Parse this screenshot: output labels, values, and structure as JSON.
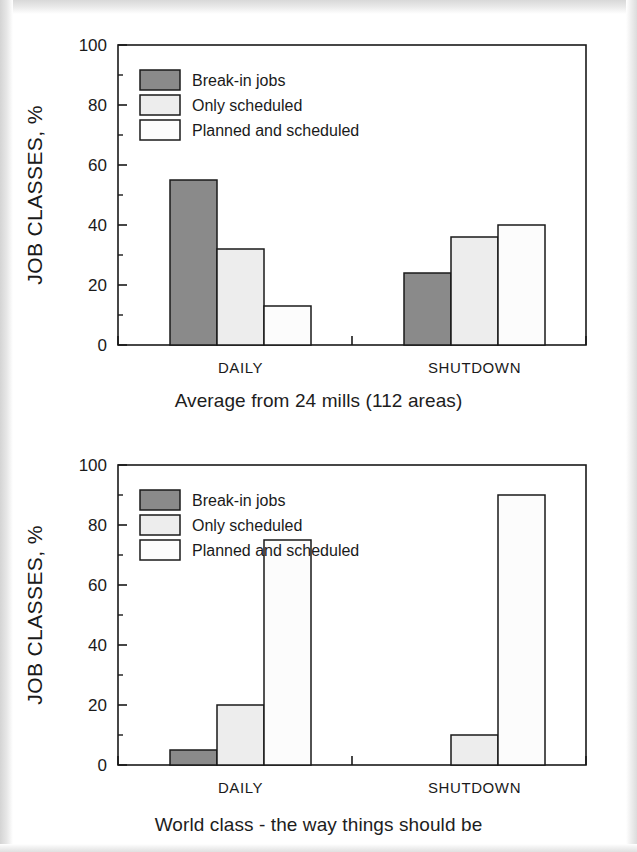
{
  "page": {
    "background": "#ffffff",
    "border_color": "#e3e3e3"
  },
  "palette": {
    "break_in": "#8a8a8a",
    "only_scheduled": "#ededed",
    "planned_scheduled": "#fcfcfc",
    "axis": "#1a1a1a",
    "text": "#1a1a1a"
  },
  "legend": {
    "items": [
      {
        "label": "Break-in jobs",
        "color": "#8a8a8a"
      },
      {
        "label": "Only scheduled",
        "color": "#ededed"
      },
      {
        "label": "Planned and scheduled",
        "color": "#fcfcfc"
      }
    ]
  },
  "axis": {
    "y_title": "JOB CLASSES, %",
    "y_ticks": [
      "0",
      "20",
      "40",
      "60",
      "80",
      "100"
    ],
    "categories": [
      "DAILY",
      "SHUTDOWN"
    ]
  },
  "charts": [
    {
      "id": "chart-top",
      "caption": "Average from 24 mills (112 areas)"
    },
    {
      "id": "chart-bot",
      "caption": "World class - the way things should be"
    }
  ],
  "chart_data": [
    {
      "type": "bar",
      "title": "Average from 24 mills (112 areas)",
      "xlabel": "",
      "ylabel": "JOB CLASSES, %",
      "ylim": [
        0,
        100
      ],
      "yticks": [
        0,
        20,
        40,
        60,
        80,
        100
      ],
      "minor_yticks": [
        10,
        30,
        50,
        70,
        90
      ],
      "grid": false,
      "legend_position": "upper-left inside plot",
      "categories": [
        "DAILY",
        "SHUTDOWN"
      ],
      "series": [
        {
          "name": "Break-in jobs",
          "values": [
            55,
            24
          ],
          "color": "#8a8a8a"
        },
        {
          "name": "Only scheduled",
          "values": [
            32,
            36
          ],
          "color": "#ededed"
        },
        {
          "name": "Planned and scheduled",
          "values": [
            13,
            40
          ],
          "color": "#fcfcfc"
        }
      ]
    },
    {
      "type": "bar",
      "title": "World class - the way things should be",
      "xlabel": "",
      "ylabel": "JOB CLASSES, %",
      "ylim": [
        0,
        100
      ],
      "yticks": [
        0,
        20,
        40,
        60,
        80,
        100
      ],
      "minor_yticks": [
        10,
        30,
        50,
        70,
        90
      ],
      "grid": false,
      "legend_position": "upper-left inside plot",
      "categories": [
        "DAILY",
        "SHUTDOWN"
      ],
      "series": [
        {
          "name": "Break-in jobs",
          "values": [
            5,
            0
          ],
          "color": "#8a8a8a"
        },
        {
          "name": "Only scheduled",
          "values": [
            20,
            10
          ],
          "color": "#ededed"
        },
        {
          "name": "Planned and scheduled",
          "values": [
            75,
            90
          ],
          "color": "#fcfcfc"
        }
      ]
    }
  ]
}
